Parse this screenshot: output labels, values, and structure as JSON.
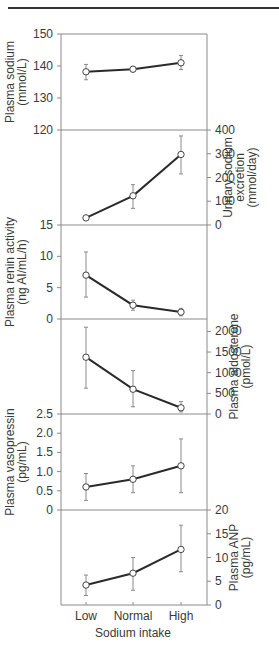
{
  "chart_data": {
    "type": "line",
    "layout": "vertically stacked panels sharing x-axis, alternating left/right y-axes",
    "xlabel": "Sodium intake",
    "categories": [
      "Low",
      "Normal",
      "High"
    ],
    "grid": false,
    "panels": [
      {
        "name": "plasma-sodium",
        "ylabel_lines": [
          "Plasma sodium",
          "(mmol/L)"
        ],
        "axis_side": "left",
        "ylim": [
          120,
          150
        ],
        "ticks": [
          120,
          130,
          140,
          150
        ],
        "values": [
          138.2,
          139.0,
          141.0
        ],
        "err_low": [
          135.7,
          138.2,
          138.9
        ],
        "err_high": [
          140.5,
          139.7,
          143.3
        ]
      },
      {
        "name": "urinary-sodium-excretion",
        "ylabel_lines": [
          "Urinary sodium",
          "excretion",
          "(mmol/day)"
        ],
        "axis_side": "right",
        "ylim": [
          0,
          400
        ],
        "ticks": [
          0,
          100,
          200,
          300,
          400
        ],
        "values": [
          30,
          123,
          297
        ],
        "err_low": [
          30,
          70,
          215
        ],
        "err_high": [
          30,
          170,
          375
        ]
      },
      {
        "name": "plasma-renin-activity",
        "ylabel_lines": [
          "Plasma renin activity",
          "(ng AI/mL/h)"
        ],
        "axis_side": "left",
        "ylim": [
          0,
          15
        ],
        "ticks": [
          0,
          5,
          10,
          15
        ],
        "values": [
          7.0,
          2.2,
          1.1
        ],
        "err_low": [
          3.5,
          1.4,
          0.5
        ],
        "err_high": [
          10.7,
          3.0,
          1.7
        ]
      },
      {
        "name": "plasma-aldosterone",
        "ylabel_lines": [
          "Plasma aldosterone",
          "(pmol/L)"
        ],
        "axis_side": "right",
        "ylim": [
          0,
          2300
        ],
        "ticks": [
          0,
          500,
          1000,
          1500,
          2000
        ],
        "values": [
          1375,
          600,
          150
        ],
        "err_low": [
          625,
          175,
          50
        ],
        "err_high": [
          2100,
          1050,
          300
        ]
      },
      {
        "name": "plasma-vasopressin",
        "ylabel_lines": [
          "Plasma vasopressin",
          "(pg/mL)"
        ],
        "axis_side": "left",
        "ylim": [
          0,
          2.5
        ],
        "ticks": [
          0,
          0.5,
          1.0,
          1.5,
          2.0,
          2.5
        ],
        "tick_labels": [
          "0",
          "0.5",
          "1.0",
          "1.5",
          "2.0",
          "2.5"
        ],
        "values": [
          0.6,
          0.8,
          1.15
        ],
        "err_low": [
          0.25,
          0.45,
          0.45
        ],
        "err_high": [
          0.95,
          1.15,
          1.85
        ]
      },
      {
        "name": "plasma-anp",
        "ylabel_lines": [
          "Plasma ANP",
          "(pg/mL)"
        ],
        "axis_side": "right",
        "ylim": [
          0,
          20
        ],
        "ticks": [
          0,
          5,
          10,
          15,
          20
        ],
        "values": [
          4.2,
          6.7,
          11.7
        ],
        "err_low": [
          2.0,
          3.1,
          7.0
        ],
        "err_high": [
          6.3,
          10.0,
          16.8
        ]
      }
    ]
  },
  "labels": {
    "xlabel": "Sodium intake",
    "categories": [
      "Low",
      "Normal",
      "High"
    ]
  }
}
